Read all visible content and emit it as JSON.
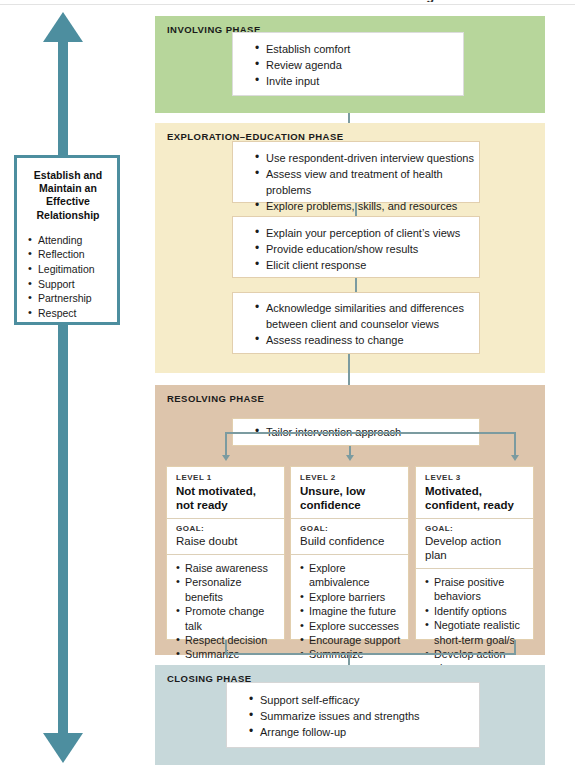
{
  "figure": {
    "title_sliver": "FIGURE 9   Phases and Processes of Patient-Centered Counseling",
    "colors": {
      "involving_band": "#b7d69b",
      "exploration_band": "#f6ecc9",
      "resolving_band": "#ddc5ac",
      "closing_band": "#c7d8da",
      "arrow_teal": "#4d8e9f",
      "connector": "#7b9ba0",
      "card_bg": "#ffffff",
      "card_border": "#e2cfae"
    }
  },
  "relationship": {
    "heading": "Establish and Maintain an Effective Relationship",
    "items": [
      "Attending",
      "Reflection",
      "Legitimation",
      "Support",
      "Partnership",
      "Respect"
    ]
  },
  "phases": {
    "involving": {
      "title": "INVOLVING PHASE",
      "card": [
        "Establish comfort",
        "Review agenda",
        "Invite input"
      ]
    },
    "exploration": {
      "title": "EXPLORATION–EDUCATION PHASE",
      "card1": [
        "Use respondent-driven interview questions",
        "Assess view and treatment of health problems",
        "Explore problems, skills, and resources"
      ],
      "card2": [
        "Explain your perception of client’s views",
        "Provide education/show results",
        "Elicit client response"
      ],
      "card3": [
        "Acknowledge similarities and differences",
        "between client and counselor views",
        "Assess readiness to change"
      ]
    },
    "resolving": {
      "title": "RESOLVING PHASE",
      "tailor": "Tailor intervention approach",
      "levels": [
        {
          "tag": "LEVEL 1",
          "name": "Not motivated, not ready",
          "goal_tag": "GOAL:",
          "goal": "Raise doubt",
          "items": [
            "Raise awareness",
            "Personalize benefits",
            "Promote change talk",
            "Respect decision",
            "Summarize",
            "Offer professional"
          ],
          "last_cont": "advice"
        },
        {
          "tag": "LEVEL 2",
          "name": "Unsure, low confidence",
          "goal_tag": "GOAL:",
          "goal": "Build confidence",
          "items": [
            "Explore ambivalence",
            "Explore barriers",
            "Imagine the future",
            "Explore successes",
            "Encourage support",
            "Summarize",
            "Ask about next step"
          ],
          "last_cont": ""
        },
        {
          "tag": "LEVEL 3",
          "name": "Motivated, confident, ready",
          "goal_tag": "GOAL:",
          "goal": "Develop action plan",
          "items": [
            "Praise positive",
            "Identify options",
            "Negotiate realistic",
            "Develop action plan"
          ],
          "cont1": "behaviors",
          "cont2": "short-term goal/s",
          "last_cont": ""
        }
      ]
    },
    "closing": {
      "title": "CLOSING PHASE",
      "card": [
        "Support self-efficacy",
        "Summarize issues and strengths",
        "Arrange follow-up"
      ]
    }
  }
}
